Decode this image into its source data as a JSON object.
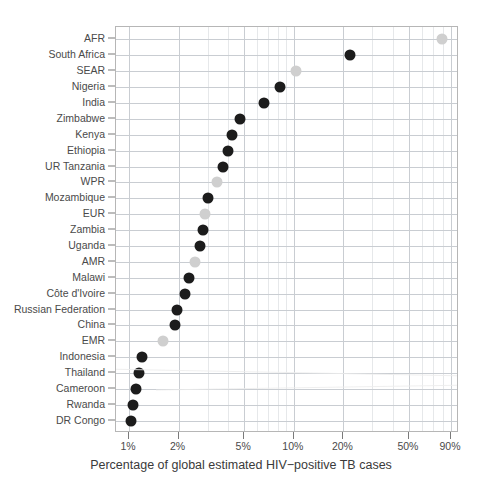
{
  "chart_data": {
    "type": "scatter",
    "title": "",
    "xlabel": "Percentage of global estimated HIV−positive TB cases",
    "ylabel": "",
    "x_scale": "log",
    "grid": true,
    "legend": "none",
    "xlim": [
      0.95,
      95
    ],
    "x_tick_labels": [
      "1%",
      "2%",
      "5%",
      "10%",
      "20%",
      "50%",
      "90%"
    ],
    "x_tick_values": [
      1,
      2,
      5,
      10,
      20,
      50,
      90
    ],
    "series": [
      {
        "name": "WHO region",
        "color": "#cfcfcf",
        "points": [
          {
            "label": "AFR",
            "value": 79
          },
          {
            "label": "SEAR",
            "value": 10.3
          },
          {
            "label": "WPR",
            "value": 3.4
          },
          {
            "label": "EUR",
            "value": 2.9
          },
          {
            "label": "AMR",
            "value": 2.5
          },
          {
            "label": "EMR",
            "value": 1.6
          }
        ]
      },
      {
        "name": "Country",
        "color": "#1c1c1c",
        "points": [
          {
            "label": "South Africa",
            "value": 22
          },
          {
            "label": "Nigeria",
            "value": 8.3
          },
          {
            "label": "India",
            "value": 6.6
          },
          {
            "label": "Zimbabwe",
            "value": 4.7
          },
          {
            "label": "Kenya",
            "value": 4.2
          },
          {
            "label": "Ethiopia",
            "value": 4.0
          },
          {
            "label": "UR Tanzania",
            "value": 3.7
          },
          {
            "label": "Mozambique",
            "value": 3.0
          },
          {
            "label": "Zambia",
            "value": 2.8
          },
          {
            "label": "Uganda",
            "value": 2.7
          },
          {
            "label": "Malawi",
            "value": 2.3
          },
          {
            "label": "Côte d'Ivoire",
            "value": 2.2
          },
          {
            "label": "Russian Federation",
            "value": 1.95
          },
          {
            "label": "China",
            "value": 1.9
          },
          {
            "label": "Indonesia",
            "value": 1.2
          },
          {
            "label": "Thailand",
            "value": 1.15
          },
          {
            "label": "Cameroon",
            "value": 1.1
          },
          {
            "label": "Rwanda",
            "value": 1.05
          },
          {
            "label": "DR Congo",
            "value": 1.03
          }
        ]
      }
    ],
    "categories": [
      "AFR",
      "South Africa",
      "SEAR",
      "Nigeria",
      "India",
      "Zimbabwe",
      "Kenya",
      "Ethiopia",
      "UR Tanzania",
      "WPR",
      "Mozambique",
      "EUR",
      "Zambia",
      "Uganda",
      "AMR",
      "Malawi",
      "Côte d'Ivoire",
      "Russian Federation",
      "China",
      "EMR",
      "Indonesia",
      "Thailand",
      "Cameroon",
      "Rwanda",
      "DR Congo"
    ],
    "values": [
      79,
      22,
      10.3,
      8.3,
      6.6,
      4.7,
      4.2,
      4.0,
      3.7,
      3.4,
      3.0,
      2.9,
      2.8,
      2.7,
      2.5,
      2.3,
      2.2,
      1.95,
      1.9,
      1.6,
      1.2,
      1.15,
      1.1,
      1.05,
      1.03
    ],
    "point_kinds": [
      "region",
      "country",
      "region",
      "country",
      "country",
      "country",
      "country",
      "country",
      "country",
      "region",
      "country",
      "region",
      "country",
      "country",
      "region",
      "country",
      "country",
      "country",
      "country",
      "region",
      "country",
      "country",
      "country",
      "country",
      "country"
    ],
    "colors": {
      "region_point": "#cfcfcf",
      "country_point": "#1c1c1c",
      "grid_major": "#c9cdd2",
      "grid_minor": "#e6e8ea",
      "panel_border": "#b6b6b6",
      "text": "#3d3d3d",
      "background": "#ffffff"
    }
  }
}
